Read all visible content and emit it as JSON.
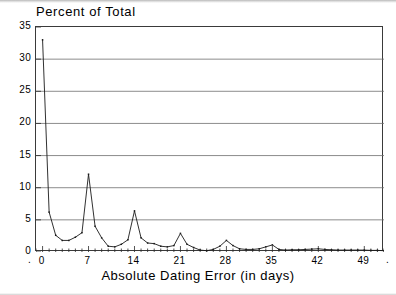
{
  "chart_data": {
    "type": "line",
    "title": "Percent of Total",
    "xlabel": "Absolute Dating Error (in days)",
    "ylabel": "",
    "xlim": [
      -1,
      52
    ],
    "ylim": [
      0,
      35
    ],
    "grid": "horizontal",
    "legend": "none",
    "marker": "point",
    "line_color": "#1a1a1a",
    "grid_color": "#6f6f6f",
    "frame_color": "#3a3a3a",
    "x_ticks_major": [
      0,
      7,
      14,
      21,
      28,
      35,
      42,
      49
    ],
    "x_tick_labels": [
      "0",
      "7",
      "14",
      "21",
      "28",
      "35",
      "42",
      "49"
    ],
    "x_tick_minor_step": 1,
    "y_ticks": [
      0,
      5,
      10,
      15,
      20,
      25,
      30,
      35
    ],
    "y_tick_labels": [
      "0",
      "5",
      "10",
      "15",
      "20",
      "25",
      "30",
      "35"
    ],
    "x": [
      0,
      1,
      2,
      3,
      4,
      5,
      6,
      7,
      8,
      9,
      10,
      11,
      12,
      13,
      14,
      15,
      16,
      17,
      18,
      19,
      20,
      21,
      22,
      23,
      24,
      25,
      26,
      27,
      28,
      29,
      30,
      31,
      32,
      33,
      34,
      35,
      36,
      37,
      38,
      39,
      40,
      41,
      42,
      43,
      44,
      45,
      46,
      47,
      48,
      49,
      50,
      51,
      52
    ],
    "values": [
      33.0,
      6.2,
      2.6,
      1.8,
      1.8,
      2.3,
      3.0,
      12.1,
      4.0,
      2.2,
      0.9,
      0.8,
      1.2,
      1.9,
      6.4,
      2.2,
      1.4,
      1.3,
      0.9,
      0.8,
      1.0,
      2.9,
      1.2,
      0.7,
      0.3,
      0.2,
      0.4,
      0.9,
      1.8,
      1.0,
      0.5,
      0.4,
      0.4,
      0.5,
      0.8,
      1.1,
      0.4,
      0.3,
      0.35,
      0.35,
      0.4,
      0.45,
      0.5,
      0.4,
      0.35,
      0.3,
      0.3,
      0.3,
      0.3,
      0.3,
      0.25,
      0.25,
      0.2
    ]
  },
  "axes": {
    "y_labels": [
      "35",
      "30",
      "25",
      "20",
      "15",
      "10",
      "5",
      "0"
    ],
    "x_labels": [
      "0",
      "7",
      "14",
      "21",
      "28",
      "35",
      "42",
      "49"
    ]
  },
  "title": "Percent of Total",
  "xaxis_title": "Absolute Dating Error (in days)",
  "corner_marks": {
    "left": ".",
    "right": "."
  }
}
